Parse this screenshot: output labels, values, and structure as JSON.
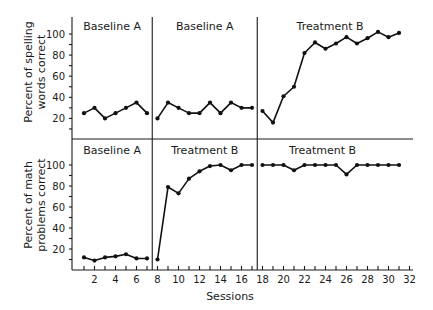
{
  "chart_data": {
    "type": "line",
    "title": "",
    "xlabel": "Sessions",
    "x_ticks": [
      2,
      4,
      6,
      8,
      10,
      12,
      14,
      16,
      18,
      20,
      22,
      24,
      26,
      28,
      30,
      32
    ],
    "xlim": [
      0,
      32
    ],
    "grid": false,
    "legend": null,
    "panels": [
      {
        "id": "spelling",
        "ylabel": [
          "Percent of spelling",
          "words correct"
        ],
        "y_ticks": [
          20,
          40,
          60,
          80,
          100
        ],
        "ylim": [
          0,
          110
        ],
        "phases": [
          {
            "label": "Baseline A",
            "sessions": [
              1,
              2,
              3,
              4,
              5,
              6,
              7
            ],
            "values": [
              25,
              30,
              20,
              25,
              30,
              35,
              25
            ]
          },
          {
            "label": "Baseline A",
            "sessions": [
              8,
              9,
              10,
              11,
              12,
              13,
              14,
              15,
              16,
              17
            ],
            "values": [
              20,
              35,
              30,
              25,
              25,
              35,
              25,
              35,
              30,
              30
            ]
          },
          {
            "label": "Treatment B",
            "sessions": [
              18,
              19,
              20,
              21,
              22,
              23,
              24,
              25,
              26,
              27,
              28,
              29,
              30,
              31
            ],
            "values": [
              27,
              16,
              41,
              50,
              82,
              92,
              86,
              91,
              97,
              91,
              96,
              102,
              97,
              101
            ]
          }
        ],
        "phase_dividers": [
          7.5,
          17.5
        ]
      },
      {
        "id": "math",
        "ylabel": [
          "Percent of math",
          "problems correct"
        ],
        "y_ticks": [
          20,
          40,
          60,
          80,
          100
        ],
        "ylim": [
          0,
          110
        ],
        "phases": [
          {
            "label": "Baseline A",
            "sessions": [
              1,
              2,
              3,
              4,
              5,
              6,
              7
            ],
            "values": [
              12,
              9,
              12,
              13,
              15,
              11,
              11
            ]
          },
          {
            "label": "Treatment B",
            "sessions": [
              8,
              9,
              10,
              11,
              12,
              13,
              14,
              15,
              16,
              17
            ],
            "values": [
              10,
              79,
              73,
              87,
              94,
              99,
              100,
              95,
              100,
              100
            ]
          },
          {
            "label": "Treatment B",
            "sessions": [
              18,
              19,
              20,
              21,
              22,
              23,
              24,
              25,
              26,
              27,
              28,
              29,
              30,
              31
            ],
            "values": [
              100,
              100,
              100,
              95,
              100,
              100,
              100,
              100,
              91,
              100,
              100,
              100,
              100,
              100
            ]
          }
        ],
        "phase_dividers": [
          7.5,
          17.5
        ]
      }
    ]
  }
}
